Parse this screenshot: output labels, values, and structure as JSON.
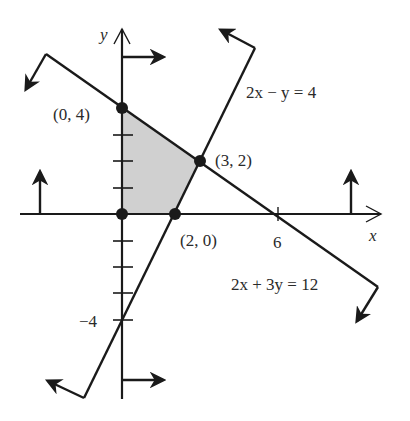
{
  "figure": {
    "type": "feasible-region-graph",
    "axes": {
      "x_label": "x",
      "y_label": "y",
      "x_ticks": [
        1,
        2,
        3,
        4,
        5,
        6
      ],
      "y_ticks": [
        -4,
        -3,
        -2,
        -1,
        1,
        2,
        3,
        4
      ],
      "labeled_x_tick": "6",
      "labeled_y_tick": "−4"
    },
    "lines": [
      {
        "id": "line-a",
        "equation_label": "2x + 3y = 12",
        "points": [
          [
            0,
            4
          ],
          [
            6,
            0
          ]
        ]
      },
      {
        "id": "line-b",
        "equation_label": "2x − y = 4",
        "points": [
          [
            2,
            0
          ],
          [
            0,
            -4
          ]
        ]
      }
    ],
    "vertices": [
      {
        "label": "(0, 4)",
        "x": 0,
        "y": 4
      },
      {
        "label": "(3, 2)",
        "x": 3,
        "y": 2
      },
      {
        "label": "(2, 0)",
        "x": 2,
        "y": 0
      },
      {
        "label": "",
        "x": 0,
        "y": 0
      }
    ],
    "feasible_region": [
      [
        0,
        0
      ],
      [
        0,
        4
      ],
      [
        3,
        2
      ],
      [
        2,
        0
      ]
    ],
    "colors": {
      "stroke": "#1a1a1a",
      "shade": "#d0d0d0",
      "text": "#2a2a2a"
    }
  },
  "labels": {
    "y_axis": "y",
    "x_axis": "x",
    "tick_6": "6",
    "tick_neg4": "−4",
    "v04": "(0, 4)",
    "v32": "(3, 2)",
    "v20": "(2, 0)",
    "eq_b": "2x − y = 4",
    "eq_a": "2x + 3y = 12"
  }
}
